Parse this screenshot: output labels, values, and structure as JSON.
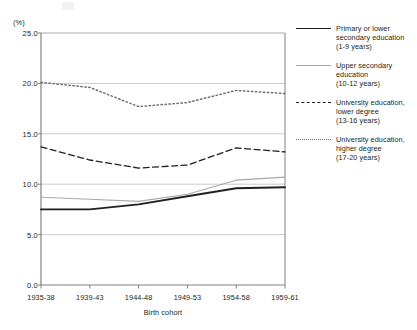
{
  "chart_data": {
    "type": "line",
    "title": "",
    "xlabel": "Birth cohort",
    "ylabel": "(%)",
    "unit_label": "(%)",
    "categories": [
      "1935-38",
      "1939-43",
      "1944-48",
      "1949-53",
      "1954-58",
      "1959-61"
    ],
    "ylim": [
      0.0,
      25.0
    ],
    "yticks": [
      "0.0",
      "5.0",
      "10.0",
      "15.0",
      "20.0",
      "25.0"
    ],
    "ytick_values": [
      0.0,
      5.0,
      10.0,
      15.0,
      20.0,
      25.0
    ],
    "grid": "horizontal",
    "legend_position": "right",
    "series": [
      {
        "name": "Primary or lower secondary education (1-9 years)",
        "label_line1": "Primary or lower",
        "label_line2": "secondary education",
        "label_line3": "(1-9 years)",
        "style": "solid-thick",
        "color": "#231f20",
        "values": [
          7.5,
          7.5,
          8.0,
          8.8,
          9.6,
          9.7
        ]
      },
      {
        "name": "Upper secondary education (10-12 years)",
        "label_line1": "Upper secondary",
        "label_line2": "education",
        "label_line3": "(10-12 years)",
        "style": "solid-thin",
        "color": "#a7a9ac",
        "values": [
          8.7,
          8.5,
          8.3,
          9.0,
          10.4,
          10.7
        ]
      },
      {
        "name": "University education, lower degree (13-16 years)",
        "label_line1": "University education,",
        "label_line2": "lower degree",
        "label_line3": "(13-16 years)",
        "style": "dashed",
        "color": "#231f20",
        "values": [
          13.7,
          12.4,
          11.6,
          11.9,
          13.6,
          13.2
        ]
      },
      {
        "name": "University education, higher degree (17-20 years)",
        "label_line1": "University education,",
        "label_line2": "higher degree",
        "label_line3": "(17-20 years)",
        "style": "dotted",
        "color": "#6d6e71",
        "values": [
          20.1,
          19.6,
          17.7,
          18.1,
          19.3,
          19.0
        ]
      }
    ]
  }
}
